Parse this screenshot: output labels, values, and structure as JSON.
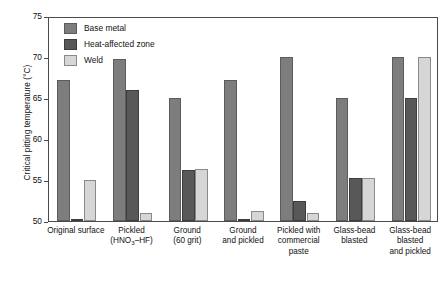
{
  "chart_data": {
    "type": "bar",
    "title": "",
    "xlabel": "",
    "ylabel": "Critical pitting temperature (°C)",
    "ylim": [
      50,
      75
    ],
    "yticks": [
      50,
      55,
      60,
      65,
      70,
      75
    ],
    "ytick_labels": [
      "50",
      "55",
      "60",
      "65",
      "70",
      "75"
    ],
    "grid": false,
    "legend_position": "top-left inside axes",
    "categories": [
      "Original surface",
      "Pickled (HNO₃–HF)",
      "Ground (60 grit)",
      "Ground and pickled",
      "Pickled with commercial paste",
      "Glass-bead blasted",
      "Glass-bead blasted and pickled"
    ],
    "category_label_lines": [
      [
        "Original surface"
      ],
      [
        "Pickled",
        "(HNO<sub>3</sub>–HF)"
      ],
      [
        "Ground",
        "(60 grit)"
      ],
      [
        "Ground",
        "and pickled"
      ],
      [
        "Pickled with",
        "commercial",
        "paste"
      ],
      [
        "Glass-bead",
        "blasted"
      ],
      [
        "Glass-bead",
        "blasted",
        "and pickled"
      ]
    ],
    "series": [
      {
        "name": "Base metal",
        "color": "#7d7d7d",
        "values": [
          67.2,
          69.7,
          65.0,
          67.2,
          70.0,
          65.0,
          70.0
        ]
      },
      {
        "name": "Heat-affected zone",
        "color": "#585858",
        "values": [
          50.0,
          66.0,
          56.2,
          50.0,
          52.5,
          55.2,
          65.0
        ]
      },
      {
        "name": "Weld",
        "color": "#d6d6d6",
        "values": [
          55.0,
          51.0,
          56.4,
          51.2,
          51.0,
          55.2,
          70.0
        ]
      }
    ]
  },
  "legend": {
    "items": [
      {
        "label": "Base metal",
        "swatch": "base"
      },
      {
        "label": "Heat-affected zone",
        "swatch": "haz"
      },
      {
        "label": "Weld",
        "swatch": "weld"
      }
    ]
  },
  "axes": {
    "y_title": "Critical pitting temperature (°C)"
  }
}
